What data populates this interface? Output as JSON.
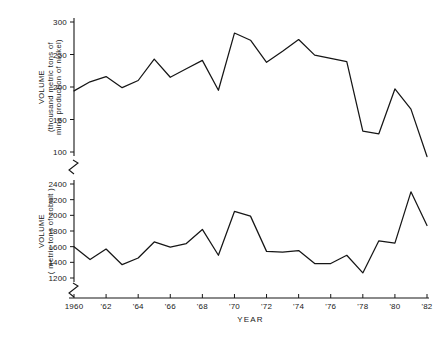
{
  "figure": {
    "x_axis_title": "YEAR",
    "x_tick_labels": [
      "1960",
      "'62",
      "'64",
      "'66",
      "'68",
      "'70",
      "'72",
      "'74",
      "'76",
      "'78",
      "'80",
      "'82"
    ],
    "x_range": [
      1960,
      1982
    ],
    "panels": [
      {
        "id": "nickel",
        "y_axis_label_line1": "VOLUME",
        "y_axis_label_line2": "(thousand metric tons of",
        "y_axis_label_line3": "mine production of nickel)",
        "y_tick_labels": [
          "100",
          "150",
          "200",
          "250",
          "300"
        ]
      },
      {
        "id": "cobalt",
        "y_axis_label_line1": "VOLUME",
        "y_axis_label_line2": "( metric tons of cobalt )",
        "y_tick_labels": [
          "1200",
          "1400",
          "1600",
          "1800",
          "2000",
          "2200",
          "2400"
        ]
      }
    ]
  },
  "chart_data": [
    {
      "type": "line",
      "title": "",
      "xlabel": "YEAR",
      "ylabel": "VOLUME (thousand metric tons of mine production of nickel)",
      "xlim": [
        1960,
        1982
      ],
      "ylim": [
        85,
        305
      ],
      "yticks": [
        100,
        150,
        200,
        250,
        300
      ],
      "xticks": [
        1960,
        1962,
        1964,
        1966,
        1968,
        1970,
        1972,
        1974,
        1976,
        1978,
        1980,
        1982
      ],
      "grid": false,
      "legend": "none",
      "axis_break": true,
      "x": [
        1960,
        1961,
        1962,
        1963,
        1964,
        1965,
        1966,
        1967,
        1968,
        1969,
        1970,
        1971,
        1972,
        1973,
        1974,
        1975,
        1976,
        1977,
        1978,
        1979,
        1980,
        1981,
        1982
      ],
      "values": [
        194,
        208,
        216,
        199,
        210,
        243,
        215,
        228,
        241,
        195,
        283,
        272,
        238,
        255,
        273,
        249,
        244,
        239,
        132,
        128,
        197,
        166,
        93
      ],
      "units": "thousand metric tons"
    },
    {
      "type": "line",
      "title": "",
      "xlabel": "YEAR",
      "ylabel": "VOLUME (metric tons of cobalt)",
      "xlim": [
        1960,
        1982
      ],
      "ylim": [
        1150,
        2450
      ],
      "yticks": [
        1200,
        1400,
        1600,
        1800,
        2000,
        2200,
        2400
      ],
      "xticks": [
        1960,
        1962,
        1964,
        1966,
        1968,
        1970,
        1972,
        1974,
        1976,
        1978,
        1980,
        1982
      ],
      "grid": false,
      "legend": "none",
      "axis_break": true,
      "x": [
        1960,
        1961,
        1962,
        1963,
        1964,
        1965,
        1966,
        1967,
        1968,
        1969,
        1970,
        1971,
        1972,
        1973,
        1974,
        1975,
        1976,
        1977,
        1978,
        1979,
        1980,
        1981,
        1982
      ],
      "values": [
        1600,
        1435,
        1570,
        1370,
        1455,
        1660,
        1595,
        1640,
        1820,
        1490,
        2050,
        1990,
        1540,
        1530,
        1550,
        1385,
        1385,
        1490,
        1265,
        1675,
        1645,
        2300,
        1870
      ],
      "units": "metric tons"
    }
  ]
}
